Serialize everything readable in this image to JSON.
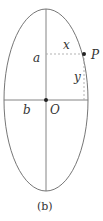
{
  "figure": {
    "caption": "(b)",
    "labels": {
      "semi_major": "a",
      "semi_minor": "b",
      "origin": "O",
      "point": "P",
      "x": "x",
      "y": "y"
    },
    "colors": {
      "stroke": "#555555",
      "dashed": "#aaaaaa",
      "point": "#222222"
    }
  }
}
